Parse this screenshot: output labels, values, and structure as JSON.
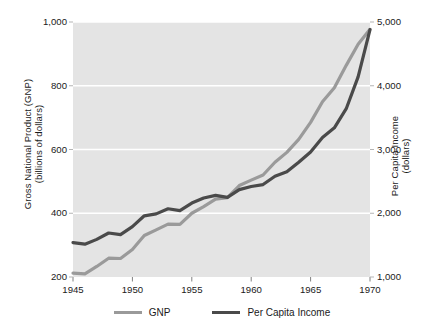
{
  "chart_data": {
    "type": "line",
    "title": "",
    "subtitle": "",
    "xlabel": "",
    "ylabel": "Gross National Product (GNP) (billions of dollars)",
    "y2label": "Per Capita Income (dollars)",
    "grid": true,
    "legend_position": "bottom",
    "xlim": [
      1945,
      1970
    ],
    "ylim": [
      200,
      1000
    ],
    "y2lim": [
      1000,
      5000
    ],
    "xticks": [
      1945,
      1950,
      1955,
      1960,
      1965,
      1970
    ],
    "xticklabels": [
      "1945",
      "1950",
      "1955",
      "1960",
      "1965",
      "1970"
    ],
    "yticks": [
      200,
      400,
      600,
      800,
      1000
    ],
    "yticklabels": [
      "200",
      "400",
      "600",
      "800",
      "1,000"
    ],
    "y2ticks": [
      1000,
      2000,
      3000,
      4000,
      5000
    ],
    "y2ticklabels": [
      "1,000",
      "2,000",
      "3,000",
      "4,000",
      "5,000"
    ],
    "x": [
      1945,
      1946,
      1947,
      1948,
      1949,
      1950,
      1951,
      1952,
      1953,
      1954,
      1955,
      1956,
      1957,
      1958,
      1959,
      1960,
      1961,
      1962,
      1963,
      1964,
      1965,
      1966,
      1967,
      1968,
      1969,
      1970
    ],
    "series": [
      {
        "name": "GNP",
        "axis": "left",
        "units": "billions of dollars",
        "color": "#9a9a9a",
        "values": [
          212,
          210,
          233,
          259,
          258,
          286,
          330,
          348,
          366,
          365,
          400,
          421,
          444,
          449,
          487,
          504,
          520,
          560,
          591,
          632,
          685,
          750,
          794,
          864,
          930,
          977
        ]
      },
      {
        "name": "Per Capita Income",
        "axis": "right",
        "units": "dollars",
        "color": "#4a4a4a",
        "values": [
          1540,
          1515,
          1590,
          1690,
          1665,
          1790,
          1960,
          1990,
          2070,
          2040,
          2160,
          2240,
          2280,
          2250,
          2370,
          2420,
          2450,
          2580,
          2650,
          2800,
          2960,
          3190,
          3340,
          3640,
          4140,
          4880
        ]
      }
    ],
    "legend": [
      {
        "label": "GNP",
        "color": "#9a9a9a"
      },
      {
        "label": "Per Capita Income",
        "color": "#4a4a4a"
      }
    ],
    "plot_background": "#e4e4e4",
    "gridline_color": "#ffffff"
  },
  "axes": {
    "left_title_line1": "Gross National Product (GNP)",
    "left_title_line2": "(billions of dollars)",
    "right_title_line1": "Per Capita Income",
    "right_title_line2": "(dollars)"
  }
}
